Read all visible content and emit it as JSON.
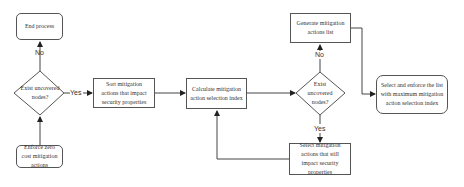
{
  "diagram": {
    "type": "flowchart",
    "nodes": {
      "end_process": "End process",
      "decision_left": "Exist uncovered nodes?",
      "enforce_zero_cost": "Enforce zero cost mitigation actions",
      "sort_actions": "Sort mitigation actions that impact security properties",
      "calculate_index": "Calculate mitigation action selection index",
      "decision_right": "Exist uncovered nodes?",
      "generate_list": "Generate mitigation actions list",
      "select_still_impact": "Select mitigation actions that still impact security properties",
      "select_enforce_max": "Select and enforce the list with maximum mitigation action selection index"
    },
    "edge_labels": {
      "left_no": "No",
      "left_yes": "Yes",
      "right_no": "No",
      "right_yes": "Yes"
    },
    "edges": [
      {
        "from": "enforce_zero_cost",
        "to": "decision_left",
        "label": ""
      },
      {
        "from": "decision_left",
        "to": "end_process",
        "label": "No"
      },
      {
        "from": "decision_left",
        "to": "sort_actions",
        "label": "Yes"
      },
      {
        "from": "sort_actions",
        "to": "calculate_index",
        "label": ""
      },
      {
        "from": "calculate_index",
        "to": "decision_right",
        "label": ""
      },
      {
        "from": "decision_right",
        "to": "generate_list",
        "label": "No"
      },
      {
        "from": "decision_right",
        "to": "select_still_impact",
        "label": "Yes"
      },
      {
        "from": "select_still_impact",
        "to": "calculate_index",
        "label": ""
      },
      {
        "from": "generate_list",
        "to": "select_enforce_max",
        "label": ""
      }
    ]
  }
}
